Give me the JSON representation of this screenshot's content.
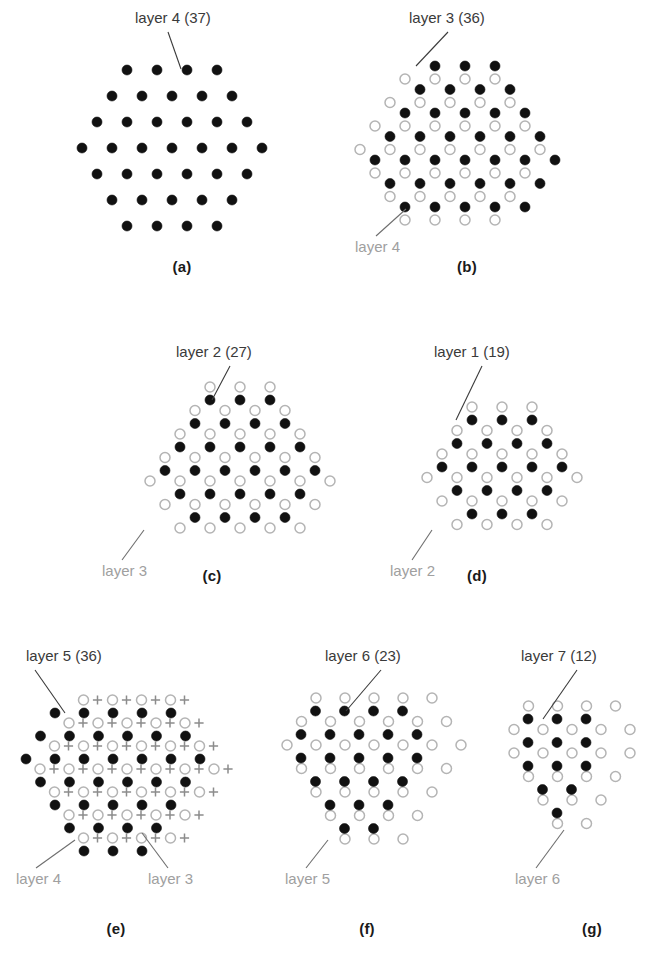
{
  "figure": {
    "background_color": "#ffffff",
    "filled_color": "#111111",
    "open_stroke_color": "#b4b4b4",
    "plus_color": "#8c8c8c",
    "label_primary_color": "#3a3a3a",
    "label_secondary_color": "#a0a0a0"
  },
  "chart_data": {
    "type": "scatter",
    "xlabel": "",
    "ylabel": "",
    "symbols": {
      "filled": "filled circle = highlighted layer",
      "open": "open circle = reference layer",
      "plus": "plus sign = additional reference layer"
    },
    "panels": [
      {
        "caption": "(a)",
        "primary_label": "layer 4 (37)",
        "primary_layer": 4,
        "primary_count": 37,
        "secondary_labels": [],
        "rows_filled": [
          4,
          5,
          6,
          7,
          6,
          5,
          4
        ],
        "rows_open": [],
        "rows_plus": []
      },
      {
        "caption": "(b)",
        "primary_label": "layer 3 (36)",
        "primary_layer": 3,
        "primary_count": 36,
        "secondary_labels": [
          "layer 4"
        ],
        "rows_filled": [
          3,
          4,
          5,
          6,
          7,
          6,
          5
        ],
        "rows_open": [
          4,
          5,
          6,
          7,
          6,
          5,
          4
        ],
        "rows_plus": []
      },
      {
        "caption": "(c)",
        "primary_label": "layer 2 (27)",
        "primary_layer": 2,
        "primary_count": 27,
        "secondary_labels": [
          "layer 3"
        ],
        "rows_filled": [
          3,
          4,
          5,
          6,
          5,
          4
        ],
        "rows_open": [
          3,
          4,
          5,
          6,
          7,
          6,
          5
        ],
        "rows_plus": []
      },
      {
        "caption": "(d)",
        "primary_label": "layer 1 (19)",
        "primary_layer": 1,
        "primary_count": 19,
        "secondary_labels": [
          "layer 2"
        ],
        "rows_filled": [
          3,
          4,
          5,
          4,
          3
        ],
        "rows_open": [
          3,
          4,
          5,
          6,
          5,
          4
        ],
        "rows_plus": []
      },
      {
        "caption": "(e)",
        "primary_label": "layer 5 (36)",
        "primary_layer": 5,
        "primary_count": 36,
        "secondary_labels": [
          "layer 4",
          "layer 3"
        ],
        "rows_filled": [
          5,
          6,
          7,
          6,
          5,
          4,
          3
        ],
        "rows_open": [
          4,
          5,
          6,
          7,
          6,
          5,
          4
        ],
        "rows_plus": [
          4,
          5,
          6,
          7,
          6,
          5,
          4
        ]
      },
      {
        "caption": "(f)",
        "primary_label": "layer 6 (23)",
        "primary_layer": 6,
        "primary_count": 23,
        "secondary_labels": [
          "layer 5"
        ],
        "rows_filled": [
          4,
          5,
          5,
          4,
          3,
          2
        ],
        "rows_open": [
          5,
          6,
          7,
          6,
          5,
          4,
          3
        ],
        "rows_plus": []
      },
      {
        "caption": "(g)",
        "primary_label": "layer 7 (12)",
        "primary_layer": 7,
        "primary_count": 12,
        "secondary_labels": [
          "layer 6"
        ],
        "rows_filled": [
          3,
          3,
          3,
          2,
          1
        ],
        "rows_open": [
          4,
          5,
          5,
          4,
          3,
          2
        ],
        "rows_plus": []
      }
    ]
  },
  "panel_a": {
    "caption": "(a)",
    "primary_label": "layer 4 (37)"
  },
  "panel_b": {
    "caption": "(b)",
    "primary_label": "layer 3 (36)",
    "secondary_label_1": "layer 4"
  },
  "panel_c": {
    "caption": "(c)",
    "primary_label": "layer 2 (27)",
    "secondary_label_1": "layer 3"
  },
  "panel_d": {
    "caption": "(d)",
    "primary_label": "layer 1 (19)",
    "secondary_label_1": "layer 2"
  },
  "panel_e": {
    "caption": "(e)",
    "primary_label": "layer 5 (36)",
    "secondary_label_1": "layer 4",
    "secondary_label_2": "layer 3"
  },
  "panel_f": {
    "caption": "(f)",
    "primary_label": "layer 6 (23)",
    "secondary_label_1": "layer 5"
  },
  "panel_g": {
    "caption": "(g)",
    "primary_label": "layer 7 (12)",
    "secondary_label_1": "layer 6"
  }
}
